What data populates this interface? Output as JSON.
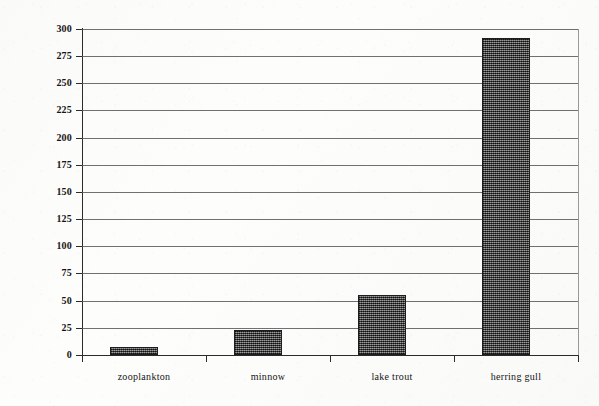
{
  "chart_data": {
    "type": "bar",
    "title": "",
    "subtitle": "",
    "xlabel": "",
    "ylabel": "PCB, ppm",
    "categories": [
      "zooplankton",
      "minnow",
      "lake trout",
      "herring gull"
    ],
    "values": [
      7,
      23,
      55,
      292
    ],
    "ylim": [
      0,
      300
    ],
    "ytick_step": 25,
    "ytick_labels": [
      "300",
      "275",
      "250",
      "225",
      "200",
      "175",
      "150",
      "125",
      "100",
      "75",
      "50",
      "25",
      "0"
    ],
    "ytick_values": [
      300,
      275,
      250,
      225,
      200,
      175,
      150,
      125,
      100,
      75,
      50,
      25,
      0
    ],
    "grid": true,
    "grid_axis": "y",
    "legend": false,
    "legend_position": "none",
    "series": [
      {
        "name": "PCB concentration",
        "values": [
          7,
          23,
          55,
          292
        ]
      }
    ],
    "bar_fill_color": "#545454",
    "bar_edge_color": "#1d1d1d",
    "axis_color": "#2b2b2b",
    "grid_color": "#575757",
    "background_color": "#fdfdfc",
    "annotations": []
  }
}
